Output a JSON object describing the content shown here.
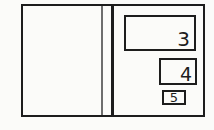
{
  "figure": {
    "background_color": "#fbfbf9",
    "stroke_color": "#1d1d1d",
    "boxes": [
      {
        "name": "box-3",
        "label": "3"
      },
      {
        "name": "box-4",
        "label": "4"
      },
      {
        "name": "box-5",
        "label": "5"
      }
    ]
  }
}
